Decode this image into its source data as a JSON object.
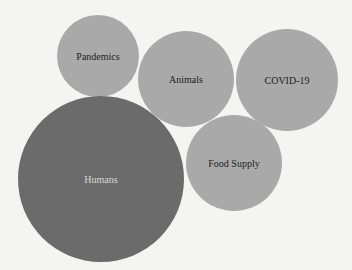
{
  "chart_data": {
    "type": "bubble",
    "title": "",
    "xlabel": "",
    "ylabel": "",
    "grid": false,
    "legend": null,
    "bubbles": [
      {
        "label": "Pandemics",
        "cx": 98,
        "cy": 56,
        "r": 41,
        "fill": "#a9a9a9",
        "text_color": "#222222"
      },
      {
        "label": "Animals",
        "cx": 186,
        "cy": 79,
        "r": 48,
        "fill": "#a9a9a9",
        "text_color": "#222222"
      },
      {
        "label": "COVID-19",
        "cx": 287,
        "cy": 80,
        "r": 51,
        "fill": "#a9a9a9",
        "text_color": "#222222"
      },
      {
        "label": "Humans",
        "cx": 101,
        "cy": 179,
        "r": 83,
        "fill": "#6b6b6b",
        "text_color": "#d8d8d8"
      },
      {
        "label": "Food Supply",
        "cx": 234,
        "cy": 163,
        "r": 48,
        "fill": "#a9a9a9",
        "text_color": "#222222"
      }
    ]
  },
  "colors": {
    "background": "#f4f4f3",
    "bubble_light": "#a9a9a9",
    "bubble_dark": "#6b6b6b"
  }
}
